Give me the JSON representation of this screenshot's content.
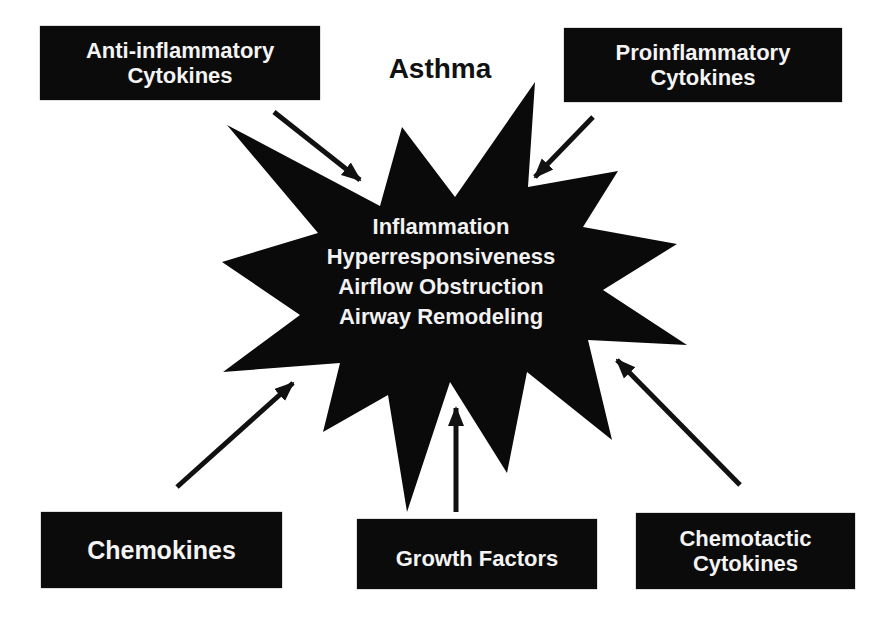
{
  "diagram": {
    "title": "Asthma",
    "center": {
      "shape": "starburst",
      "fill": "#0a0a0a",
      "lines": [
        "Inflammation",
        "Hyperresponsiveness",
        "Airflow Obstruction",
        "Airway Remodeling"
      ]
    },
    "boxes": {
      "anti_inflammatory": {
        "lines": [
          "Anti-inflammatory",
          "Cytokines"
        ],
        "arrow_direction": "toward-center"
      },
      "proinflammatory": {
        "lines": [
          "Proinflammatory",
          "Cytokines"
        ],
        "arrow_direction": "toward-center"
      },
      "chemokines": {
        "lines": [
          "Chemokines"
        ],
        "arrow_direction": "toward-center"
      },
      "growth_factors": {
        "lines": [
          "Growth Factors"
        ],
        "arrow_direction": "toward-center"
      },
      "chemotactic": {
        "lines": [
          "Chemotactic",
          "Cytokines"
        ],
        "arrow_direction": "toward-center"
      }
    },
    "colors": {
      "box_fill": "#0b0b0b",
      "box_text": "#f4f4f4",
      "arrow": "#111111",
      "background": "#ffffff"
    }
  }
}
